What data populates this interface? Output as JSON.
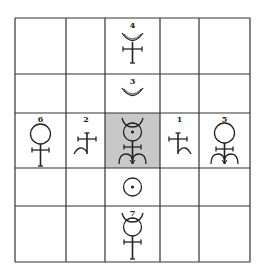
{
  "diagram": {
    "type": "5x5 grid of alchemical/astrological glyphs",
    "grid": {
      "rows": 5,
      "cols": 5,
      "col_lines_x": [
        15,
        66,
        105,
        160,
        199,
        250
      ],
      "row_lines_y": [
        18,
        74,
        113,
        168,
        206,
        262
      ],
      "line_color": "#333333",
      "highlight_cell": {
        "row": 2,
        "col": 2,
        "color": "#c8c8c8"
      }
    },
    "cells": [
      {
        "row": 0,
        "col": 2,
        "number": "4",
        "glyph": "crescent-over-cross"
      },
      {
        "row": 1,
        "col": 2,
        "number": "3",
        "glyph": "crescent"
      },
      {
        "row": 2,
        "col": 0,
        "number": "6",
        "glyph": "circle-over-cross"
      },
      {
        "row": 2,
        "col": 1,
        "number": "2",
        "glyph": "cross-with-left-hook"
      },
      {
        "row": 2,
        "col": 2,
        "number": "",
        "glyph": "horned-circle-dot-cross-double-arc"
      },
      {
        "row": 2,
        "col": 3,
        "number": "1",
        "glyph": "cross-with-right-hook"
      },
      {
        "row": 2,
        "col": 4,
        "number": "5",
        "glyph": "circle-over-cross-double-arc"
      },
      {
        "row": 3,
        "col": 2,
        "number": "",
        "glyph": "circle-with-dot"
      },
      {
        "row": 4,
        "col": 2,
        "number": "7",
        "glyph": "horned-circle-over-cross"
      }
    ]
  }
}
